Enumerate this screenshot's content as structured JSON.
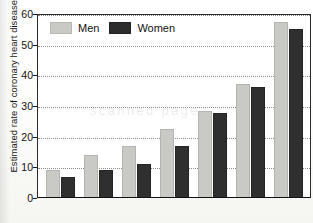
{
  "chart_data": {
    "type": "bar",
    "title": "",
    "subtitle": "",
    "xlabel": "",
    "ylabel": "Estimated rate of coronary heart disease / percentage",
    "ylim": [
      0,
      60
    ],
    "yticks": [
      0,
      10,
      20,
      30,
      40,
      50,
      60
    ],
    "ytick_labels": [
      "0",
      "10",
      "20",
      "30",
      "40",
      "50",
      "60"
    ],
    "grid": "horizontal-dotted",
    "legend_position": "top-left",
    "categories": [
      "",
      "",
      "",
      "",
      "",
      "",
      ""
    ],
    "xtick_labels_visible": false,
    "series": [
      {
        "name": "Men",
        "color": "#c9c9c6",
        "values": [
          8.8,
          13.7,
          16.6,
          22.1,
          28.0,
          36.8,
          57.0
        ]
      },
      {
        "name": "Women",
        "color": "#2f2f2f",
        "values": [
          6.5,
          8.8,
          10.8,
          16.6,
          27.3,
          36.0,
          54.7
        ]
      }
    ],
    "annotations": []
  },
  "legend": {
    "items": [
      {
        "label": "Men"
      },
      {
        "label": "Women"
      }
    ]
  },
  "artifacts": {
    "ghost_text": "scanned page"
  }
}
